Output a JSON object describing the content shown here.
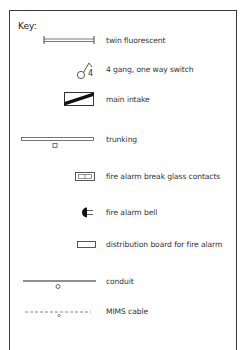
{
  "key": {
    "title": "Key:",
    "items": [
      {
        "symbol": "twin-fluorescent-icon",
        "label": "twin fluorescent"
      },
      {
        "symbol": "four-gang-switch-icon",
        "label": "4 gang, one way switch",
        "glyph_text": "4"
      },
      {
        "symbol": "main-intake-icon",
        "label": "main intake"
      },
      {
        "symbol": "trunking-icon",
        "label": "trunking"
      },
      {
        "symbol": "break-glass-icon",
        "label": "fire alarm break glass contacts"
      },
      {
        "symbol": "fire-alarm-bell-icon",
        "label": "fire alarm bell"
      },
      {
        "symbol": "distribution-board-icon",
        "label": "distribution board for fire alarm"
      },
      {
        "symbol": "conduit-icon",
        "label": "conduit"
      },
      {
        "symbol": "mims-cable-icon",
        "label": "MIMS cable"
      }
    ]
  },
  "colors": {
    "line": "#3a3a3a",
    "text": "#333333",
    "background": "#ffffff"
  }
}
